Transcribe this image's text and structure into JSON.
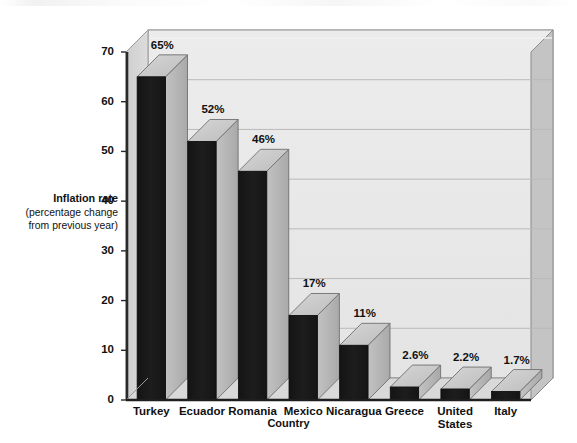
{
  "chart_data": {
    "type": "bar",
    "title": "",
    "subtitle": "",
    "xlabel": "Country",
    "ylabel": "Inflation rate",
    "ylabel_sub_line1": "(percentage change",
    "ylabel_sub_line2": "from previous year)",
    "categories": [
      "Turkey",
      "Ecuador",
      "Romania",
      "Mexico",
      "Nicaragua",
      "Greece",
      "United States",
      "Italy"
    ],
    "category_lines": [
      [
        "Turkey"
      ],
      [
        "Ecuador"
      ],
      [
        "Romania"
      ],
      [
        "Mexico"
      ],
      [
        "Nicaragua"
      ],
      [
        "Greece"
      ],
      [
        "United",
        "States"
      ],
      [
        "Italy"
      ]
    ],
    "values": [
      65,
      52,
      46,
      17,
      11,
      2.6,
      2.2,
      1.7
    ],
    "data_labels": [
      "65%",
      "52%",
      "46%",
      "17%",
      "11%",
      "2.6%",
      "2.2%",
      "1.7%"
    ],
    "ylim": [
      0,
      70
    ],
    "ytick_values": [
      0,
      10,
      20,
      30,
      40,
      50,
      60,
      70
    ],
    "ytick_labels": [
      "0",
      "10",
      "20",
      "30",
      "40",
      "50",
      "60",
      "70"
    ],
    "grid": true,
    "grid_axis": "y",
    "legend": false,
    "legend_position": "none",
    "style": "3d-column",
    "colors": {
      "bar_front": "#1b1b1b",
      "bar_top": "#c9c9c9",
      "bar_side": "#b4b4b4",
      "plot_back_wall": "#e9e9e9",
      "plot_side_wall": "#d4d4d4",
      "plot_floor": "#dcdcdc",
      "top_panel": "#cbcbcb",
      "gridline": "#b9b9b9",
      "axis_line": "#2a2a2a",
      "page_background": "#ffffff",
      "text": "#111111"
    }
  }
}
